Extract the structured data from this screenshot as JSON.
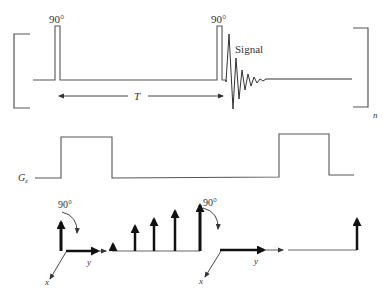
{
  "rf": {
    "pulse1_label": "90°",
    "pulse2_label": "90°",
    "signal_label": "Signal",
    "interval_label": "T",
    "repeat_label": "n"
  },
  "gradient": {
    "label_main": "G",
    "label_sub": "z"
  },
  "vectors": {
    "frame1": {
      "rotation_label": "90°",
      "axis_y": "y",
      "axis_x": "x"
    },
    "frame2": {
      "rotation_label": "90°",
      "axis_y": "y",
      "axis_x": "x"
    }
  },
  "colors": {
    "line": "#444444",
    "thick_arrow": "#111111",
    "text": "#333333"
  }
}
